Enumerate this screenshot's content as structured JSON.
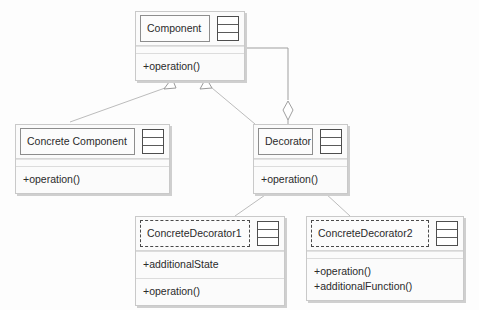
{
  "diagram": {
    "background_color": "#fdfdfd",
    "line_color": "#b0b0b0",
    "text_color": "#2b2b2b"
  },
  "classes": [
    {
      "id": "component",
      "name": "Component",
      "abstract": false,
      "icon": "class-grid-icon",
      "compartments": [
        {
          "members": [
            "+operation()"
          ]
        }
      ]
    },
    {
      "id": "concrete-component",
      "name": "Concrete Component",
      "abstract": false,
      "icon": "class-grid-icon",
      "compartments": [
        {
          "members": [
            "+operation()"
          ]
        }
      ]
    },
    {
      "id": "decorator",
      "name": "Decorator",
      "abstract": false,
      "icon": "class-grid-icon",
      "compartments": [
        {
          "members": [
            "+operation()"
          ]
        }
      ]
    },
    {
      "id": "concrete-decorator-1",
      "name": "ConcreteDecorator1",
      "abstract": true,
      "icon": "class-grid-icon",
      "compartments": [
        {
          "members": [
            "+additionalState"
          ]
        },
        {
          "members": [
            "+operation()"
          ]
        }
      ]
    },
    {
      "id": "concrete-decorator-2",
      "name": "ConcreteDecorator2",
      "abstract": true,
      "icon": "class-grid-icon",
      "compartments": [
        {
          "members": [
            "+operation()",
            "+additionalFunction()"
          ]
        }
      ]
    }
  ],
  "relationships": [
    {
      "id": "rel-cc-component",
      "type": "generalization",
      "from": "concrete-component",
      "to": "component",
      "arrow": "hollow-triangle"
    },
    {
      "id": "rel-dec-component",
      "type": "generalization",
      "from": "decorator",
      "to": "component",
      "arrow": "hollow-triangle"
    },
    {
      "id": "rel-cd1-decorator",
      "type": "generalization",
      "from": "concrete-decorator-1",
      "to": "decorator",
      "arrow": "hollow-triangle"
    },
    {
      "id": "rel-cd2-decorator",
      "type": "generalization",
      "from": "concrete-decorator-2",
      "to": "decorator",
      "arrow": "hollow-triangle"
    },
    {
      "id": "rel-component-decorator",
      "type": "aggregation",
      "from": "component",
      "to": "decorator",
      "arrow": "hollow-diamond"
    }
  ]
}
